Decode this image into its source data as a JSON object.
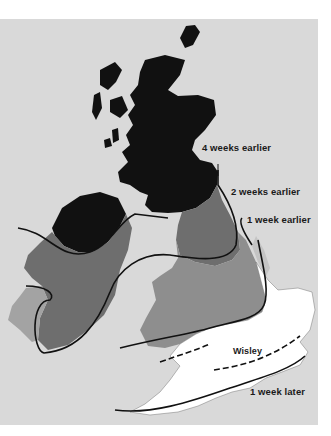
{
  "map": {
    "type": "isochrone-map",
    "subject": "Relative seasonal timing across Great Britain and Ireland",
    "colors": {
      "sea": "#d9d9d9",
      "zone_4_weeks_earlier": "#111111",
      "zone_2_weeks_earlier": "#6e6e6e",
      "zone_1_week_earlier": "#8e8e8e",
      "zone_west_coast": "#a3a3a3",
      "zone_reference": "#ffffff",
      "boundary_line": "#111111"
    },
    "labels": {
      "four_weeks": "4 weeks earlier",
      "two_weeks": "2 weeks earlier",
      "one_week_earlier": "1 week earlier",
      "reference_site": "Wisley",
      "one_week_later": "1 week later"
    }
  }
}
